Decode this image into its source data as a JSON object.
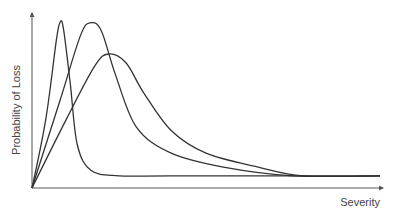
{
  "chart_data": {
    "type": "line",
    "title": "",
    "xlabel": "Severity",
    "ylabel": "Probability of Loss",
    "grid": false,
    "legend": "none",
    "xlim": [
      0,
      100
    ],
    "ylim": [
      0,
      100
    ],
    "series": [
      {
        "name": "curve-narrow",
        "points": [
          [
            0,
            0
          ],
          [
            4,
            40
          ],
          [
            7,
            85
          ],
          [
            8,
            95
          ],
          [
            9,
            92
          ],
          [
            11,
            60
          ],
          [
            13,
            25
          ],
          [
            17,
            10
          ],
          [
            25,
            7
          ],
          [
            40,
            7
          ],
          [
            100,
            7
          ]
        ]
      },
      {
        "name": "curve-medium",
        "points": [
          [
            0,
            0
          ],
          [
            8,
            50
          ],
          [
            14,
            88
          ],
          [
            17,
            95
          ],
          [
            20,
            90
          ],
          [
            24,
            65
          ],
          [
            30,
            35
          ],
          [
            40,
            20
          ],
          [
            55,
            12
          ],
          [
            75,
            7
          ],
          [
            100,
            7
          ]
        ]
      },
      {
        "name": "curve-wide",
        "points": [
          [
            0,
            0
          ],
          [
            10,
            40
          ],
          [
            18,
            70
          ],
          [
            22,
            77
          ],
          [
            27,
            72
          ],
          [
            32,
            55
          ],
          [
            40,
            33
          ],
          [
            50,
            20
          ],
          [
            65,
            12
          ],
          [
            78,
            7
          ],
          [
            100,
            7
          ]
        ]
      }
    ],
    "colors": {
      "curves": "#333333",
      "axes": "#555555",
      "labels": "#444444"
    }
  }
}
